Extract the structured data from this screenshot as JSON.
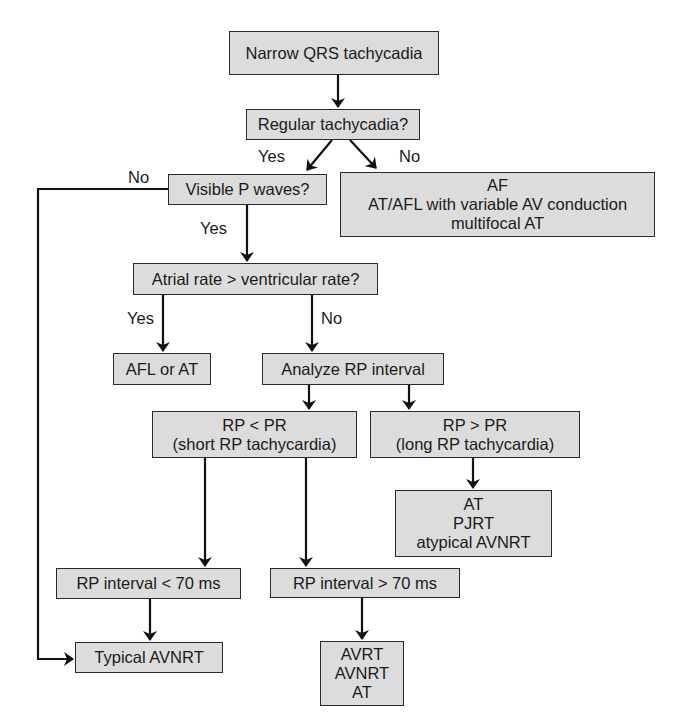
{
  "diagram": {
    "type": "flowchart",
    "colors": {
      "node_fill": "#dcdcdc",
      "node_border": "#2a2a2a",
      "line": "#111111",
      "background": "#ffffff"
    },
    "nodes": {
      "narrow_qrs": {
        "lines": [
          "Narrow QRS tachycadia"
        ]
      },
      "regular": {
        "lines": [
          "Regular tachycadia?"
        ]
      },
      "visible_p": {
        "lines": [
          "Visible P waves?"
        ]
      },
      "af_group": {
        "lines": [
          "AF",
          "AT/AFL with variable AV conduction",
          "multifocal AT"
        ]
      },
      "atrial_rate": {
        "lines": [
          "Atrial rate > ventricular rate?"
        ]
      },
      "afl_or_at": {
        "lines": [
          "AFL or AT"
        ]
      },
      "analyze_rp": {
        "lines": [
          "Analyze RP interval"
        ]
      },
      "rp_lt_pr": {
        "lines": [
          "RP < PR",
          "(short RP tachycardia)"
        ]
      },
      "rp_gt_pr": {
        "lines": [
          "RP > PR",
          "(long RP tachycardia)"
        ]
      },
      "long_rp_dx": {
        "lines": [
          "AT",
          "PJRT",
          "atypical AVNRT"
        ]
      },
      "rp_lt_70": {
        "lines": [
          "RP interval < 70 ms"
        ]
      },
      "rp_gt_70": {
        "lines": [
          "RP interval > 70 ms"
        ]
      },
      "typical_avnrt": {
        "lines": [
          "Typical AVNRT"
        ]
      },
      "short_rp_dx": {
        "lines": [
          "AVRT",
          "AVNRT",
          "AT"
        ]
      }
    },
    "edge_labels": {
      "regular_yes": "Yes",
      "regular_no": "No",
      "visible_p_no": "No",
      "visible_p_yes": "Yes",
      "atrial_rate_yes": "Yes",
      "atrial_rate_no": "No"
    },
    "edges": [
      {
        "from": "narrow_qrs",
        "to": "regular",
        "label": ""
      },
      {
        "from": "regular",
        "to": "visible_p",
        "label": "Yes"
      },
      {
        "from": "regular",
        "to": "af_group",
        "label": "No"
      },
      {
        "from": "visible_p",
        "to": "typical_avnrt",
        "label": "No"
      },
      {
        "from": "visible_p",
        "to": "atrial_rate",
        "label": "Yes"
      },
      {
        "from": "atrial_rate",
        "to": "afl_or_at",
        "label": "Yes"
      },
      {
        "from": "atrial_rate",
        "to": "analyze_rp",
        "label": "No"
      },
      {
        "from": "analyze_rp",
        "to": "rp_lt_pr",
        "label": ""
      },
      {
        "from": "analyze_rp",
        "to": "rp_gt_pr",
        "label": ""
      },
      {
        "from": "rp_gt_pr",
        "to": "long_rp_dx",
        "label": ""
      },
      {
        "from": "rp_lt_pr",
        "to": "rp_lt_70",
        "label": ""
      },
      {
        "from": "rp_lt_pr",
        "to": "rp_gt_70",
        "label": ""
      },
      {
        "from": "rp_lt_70",
        "to": "typical_avnrt",
        "label": ""
      },
      {
        "from": "rp_gt_70",
        "to": "short_rp_dx",
        "label": ""
      }
    ]
  }
}
